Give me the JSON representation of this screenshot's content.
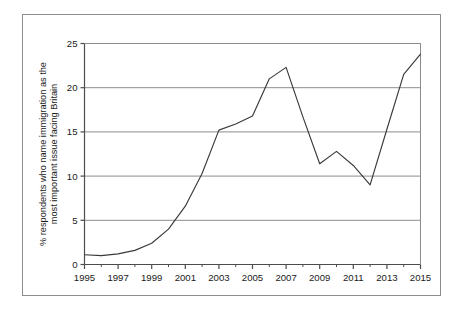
{
  "figure": {
    "background_color": "#ffffff",
    "frame_color": "#8d8d8d",
    "line_color": "#3a3a3a",
    "grid_color": "#8d8d8d",
    "axis_color": "#4d4d4d"
  },
  "axis_label": {
    "line1": "% respondents who name immigration as the",
    "line2": "most important issue facing Britain"
  },
  "chart_data": {
    "type": "line",
    "title": "",
    "xlabel": "",
    "ylabel": "% respondents who name immigration as the most important issue facing Britain",
    "xlim": [
      1995,
      2015
    ],
    "ylim": [
      0,
      25
    ],
    "grid": true,
    "legend": "none",
    "x_tick_labels": [
      "1995",
      "1997",
      "1999",
      "2001",
      "2003",
      "2005",
      "2007",
      "2009",
      "2011",
      "2013",
      "2015"
    ],
    "x_tick_values": [
      1995,
      1997,
      1999,
      2001,
      2003,
      2005,
      2007,
      2009,
      2011,
      2013,
      2015
    ],
    "x_minor_tick_values": [
      1996,
      1998,
      2000,
      2002,
      2004,
      2006,
      2008,
      2010,
      2012,
      2014
    ],
    "y_tick_labels": [
      "0",
      "5",
      "10",
      "15",
      "20",
      "25"
    ],
    "y_tick_values": [
      0,
      5,
      10,
      15,
      20,
      25
    ],
    "x": [
      1995,
      1996,
      1997,
      1998,
      1999,
      2000,
      2001,
      2002,
      2003,
      2004,
      2005,
      2006,
      2007,
      2008,
      2009,
      2010,
      2011,
      2012,
      2013,
      2014,
      2015
    ],
    "values": [
      1.1,
      1.0,
      1.2,
      1.6,
      2.4,
      4.0,
      6.6,
      10.3,
      15.2,
      15.9,
      16.8,
      21.0,
      22.3,
      16.7,
      11.4,
      12.8,
      11.2,
      9.0,
      15.3,
      21.5,
      23.8
    ],
    "series": [
      {
        "name": "immigration as most important issue",
        "values": [
          1.1,
          1.0,
          1.2,
          1.6,
          2.4,
          4.0,
          6.6,
          10.3,
          15.2,
          15.9,
          16.8,
          21.0,
          22.3,
          16.7,
          11.4,
          12.8,
          11.2,
          9.0,
          15.3,
          21.5,
          23.8
        ]
      }
    ]
  }
}
